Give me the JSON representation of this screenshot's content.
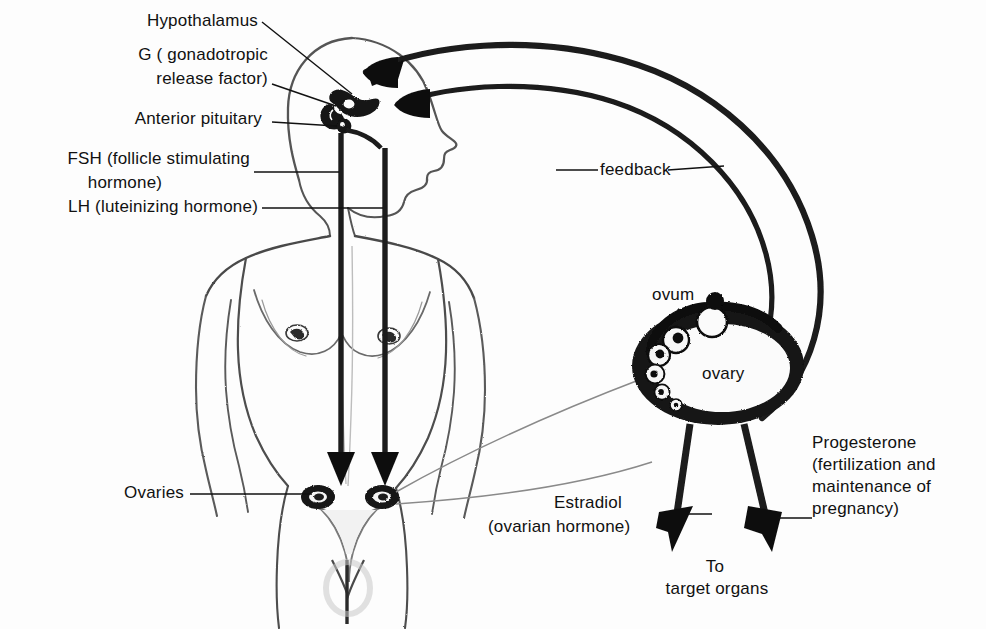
{
  "figure": {
    "style": "pencil-sketch anatomical illustration",
    "background_color": "#fdfdfd",
    "ink_color": "#111111"
  },
  "labels": {
    "hypothalamus": "Hypothalamus",
    "grf_line1": "G ( gonadotropic",
    "grf_line2": "release factor)",
    "anterior_pituitary": "Anterior pituitary",
    "fsh_line1": "FSH (follicle stimulating",
    "fsh_line2": "hormone)",
    "lh": "LH (luteinizing hormone)",
    "ovaries": "Ovaries",
    "feedback": "feedback",
    "ovum": "ovum",
    "ovary": "ovary",
    "estradiol_line1": "Estradiol",
    "estradiol_line2": "(ovarian hormone)",
    "progesterone_line1": "Progesterone",
    "progesterone_line2": "(fertilization and",
    "progesterone_line3": "maintenance of",
    "progesterone_line4": "pregnancy)",
    "target_line1": "To",
    "target_line2": "target organs"
  },
  "structures": {
    "figure_body": "female-body-outline",
    "head": "head-profile",
    "brain_hypothalamus": "hypothalamus-structure",
    "pituitary": "anterior-pituitary-gland",
    "uterus": "uterus-and-fallopian-tubes",
    "ovary_left": "ovary-left",
    "ovary_right": "ovary-right",
    "ovary_magnified": "magnified-ovary",
    "follicles": "developing-follicles-sequence",
    "released_ovum": "released-ovum"
  },
  "arrows": {
    "fsh_arrow": "fsh-down-arrow",
    "lh_arrow": "lh-down-arrow",
    "feedback_arrow_upper": "feedback-arrow-to-hypothalamus",
    "feedback_arrow_lower": "feedback-arrow-to-pituitary",
    "estradiol_arrow": "estradiol-down-arrow",
    "progesterone_arrow": "progesterone-down-arrow"
  }
}
